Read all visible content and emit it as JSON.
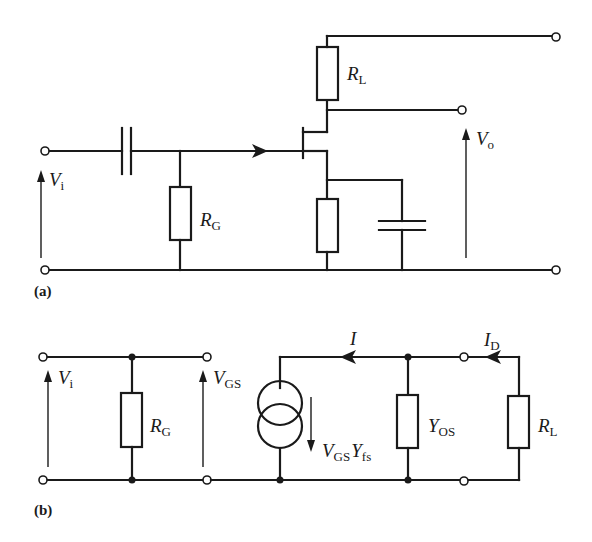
{
  "figure": {
    "panel_a": {
      "label": "(a)",
      "description": "JFET common-source amplifier",
      "input_voltage": {
        "symbol": "V",
        "subscript": "i"
      },
      "output_voltage": {
        "symbol": "V",
        "subscript": "o"
      },
      "gate_resistor": {
        "symbol": "R",
        "subscript": "G"
      },
      "load_resistor": {
        "symbol": "R",
        "subscript": "L"
      }
    },
    "panel_b": {
      "label": "(b)",
      "description": "Small-signal equivalent circuit",
      "input_voltage": {
        "symbol": "V",
        "subscript": "i"
      },
      "gate_source_voltage": {
        "symbol": "V",
        "subscript": "GS"
      },
      "gate_resistor": {
        "symbol": "R",
        "subscript": "G"
      },
      "current_source": {
        "symbol1": "V",
        "sub1": "GS",
        "symbol2": "Y",
        "sub2": "fs"
      },
      "output_admittance": {
        "symbol": "Y",
        "subscript": "OS"
      },
      "load_resistor": {
        "symbol": "R",
        "subscript": "L"
      },
      "current_I": {
        "symbol": "I"
      },
      "drain_current": {
        "symbol": "I",
        "subscript": "D"
      }
    }
  }
}
